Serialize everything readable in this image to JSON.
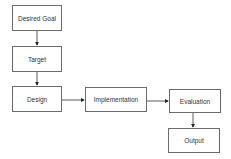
{
  "diagram": {
    "type": "flowchart",
    "nodes": [
      {
        "id": "desired_goal",
        "label": "Desired Goal"
      },
      {
        "id": "target",
        "label": "Target"
      },
      {
        "id": "design",
        "label": "Design"
      },
      {
        "id": "implementation",
        "label": "Implementation"
      },
      {
        "id": "evaluation",
        "label": "Evaluation"
      },
      {
        "id": "output",
        "label": "Output"
      }
    ],
    "edges": [
      {
        "from": "desired_goal",
        "to": "target"
      },
      {
        "from": "target",
        "to": "design"
      },
      {
        "from": "design",
        "to": "implementation"
      },
      {
        "from": "implementation",
        "to": "evaluation"
      },
      {
        "from": "evaluation",
        "to": "output"
      }
    ],
    "colors": {
      "stroke": "#6b6b6b",
      "arrow": "#222222",
      "text": "#333333"
    }
  }
}
